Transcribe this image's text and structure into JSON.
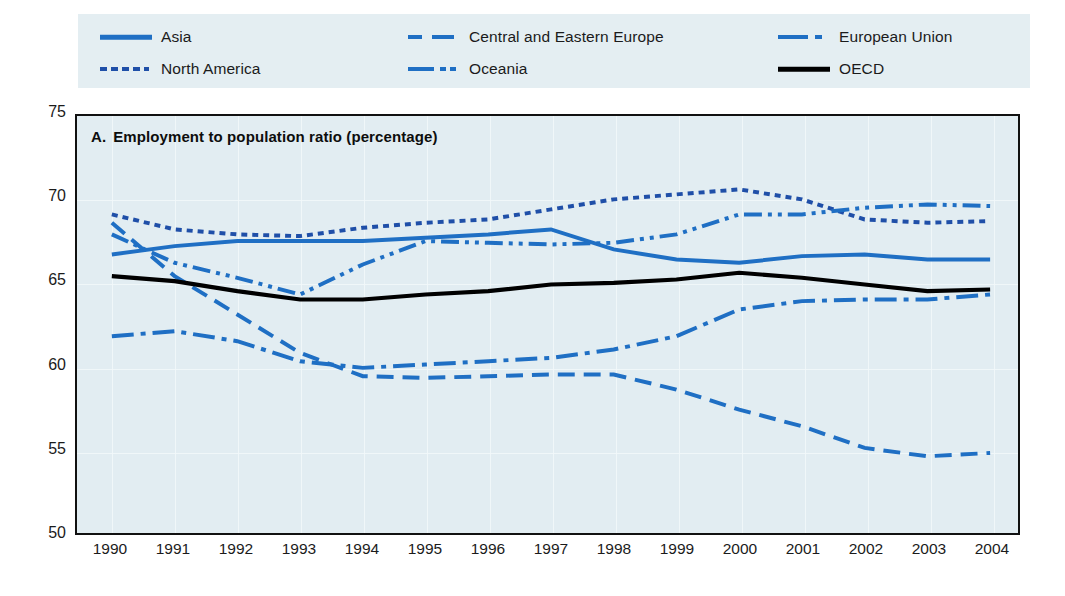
{
  "legend": {
    "items": [
      {
        "label": "Asia",
        "style": "solid",
        "color": "#1f6fc4",
        "row": 0,
        "col": 0
      },
      {
        "label": "Central and Eastern Europe",
        "style": "dashed",
        "color": "#1f6fc4",
        "row": 0,
        "col": 1
      },
      {
        "label": "European Union",
        "style": "dash-dot",
        "color": "#1f6fc4",
        "row": 0,
        "col": 2
      },
      {
        "label": "North America",
        "style": "dotted",
        "color": "#1f4fa8",
        "row": 1,
        "col": 0
      },
      {
        "label": "Oceania",
        "style": "dash-dot-dot",
        "color": "#1f6fc4",
        "row": 1,
        "col": 1
      },
      {
        "label": "OECD",
        "style": "solid",
        "color": "#000000",
        "row": 1,
        "col": 2
      }
    ]
  },
  "chart_data": {
    "type": "line",
    "title_letter": "A.",
    "title_text": "Employment to population ratio (percentage)",
    "xlabel": "",
    "ylabel": "",
    "ylim": [
      50,
      75
    ],
    "yticks": [
      75,
      70,
      65,
      60,
      55,
      50
    ],
    "grid": true,
    "legend_position": "top",
    "x": [
      1990,
      1991,
      1992,
      1993,
      1994,
      1995,
      1996,
      1997,
      1998,
      1999,
      2000,
      2001,
      2002,
      2003,
      2004
    ],
    "categories": [
      "1990",
      "1991",
      "1992",
      "1993",
      "1994",
      "1995",
      "1996",
      "1997",
      "1998",
      "1999",
      "2000",
      "2001",
      "2002",
      "2003",
      "2004"
    ],
    "series": [
      {
        "name": "Asia",
        "style": "solid",
        "color": "#1f6fc4",
        "values": [
          66.7,
          67.2,
          67.5,
          67.5,
          67.5,
          67.7,
          67.9,
          68.2,
          67.0,
          66.4,
          66.2,
          66.6,
          66.7,
          66.4,
          66.4
        ]
      },
      {
        "name": "Central and Eastern Europe",
        "style": "dashed",
        "color": "#1f6fc4",
        "values": [
          68.6,
          65.4,
          63.1,
          60.8,
          59.4,
          59.3,
          59.4,
          59.5,
          59.5,
          58.6,
          57.4,
          56.4,
          55.1,
          54.6,
          54.8
        ]
      },
      {
        "name": "European Union",
        "style": "dash-dot",
        "color": "#1f6fc4",
        "values": [
          61.8,
          62.1,
          61.5,
          60.3,
          59.9,
          60.1,
          60.3,
          60.5,
          61.0,
          61.8,
          63.4,
          63.9,
          64.0,
          64.0,
          64.3
        ]
      },
      {
        "name": "North America",
        "style": "dotted",
        "color": "#1f4fa8",
        "values": [
          69.1,
          68.2,
          67.9,
          67.8,
          68.3,
          68.6,
          68.8,
          69.4,
          70.0,
          70.3,
          70.6,
          70.0,
          68.8,
          68.6,
          68.7
        ]
      },
      {
        "name": "Oceania",
        "style": "dash-dot-dot",
        "color": "#1f6fc4",
        "values": [
          67.9,
          66.2,
          65.3,
          64.3,
          66.1,
          67.5,
          67.4,
          67.3,
          67.4,
          67.9,
          69.1,
          69.1,
          69.5,
          69.7,
          69.6
        ]
      },
      {
        "name": "OECD",
        "style": "solid",
        "color": "#000000",
        "values": [
          65.4,
          65.1,
          64.5,
          64.0,
          64.0,
          64.3,
          64.5,
          64.9,
          65.0,
          65.2,
          65.6,
          65.3,
          64.9,
          64.5,
          64.6
        ]
      }
    ]
  }
}
